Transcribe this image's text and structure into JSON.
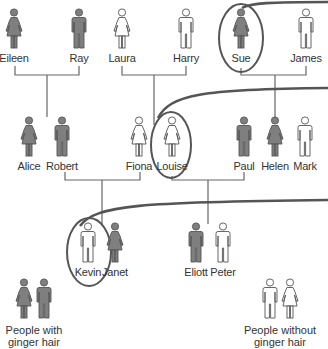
{
  "colors": {
    "ginger_fill": "#7f7f7f",
    "no_ginger_fill": "#ffffff",
    "outline": "#555555",
    "line": "#666666",
    "highlight": "#555555"
  },
  "generations": [
    {
      "row": 1,
      "people": [
        {
          "name": "Eileen",
          "sex": "female",
          "ginger": true,
          "highlighted": false
        },
        {
          "name": "Ray",
          "sex": "male",
          "ginger": true,
          "highlighted": false
        },
        {
          "name": "Laura",
          "sex": "female",
          "ginger": false,
          "highlighted": false
        },
        {
          "name": "Harry",
          "sex": "male",
          "ginger": false,
          "highlighted": false
        },
        {
          "name": "Sue",
          "sex": "female",
          "ginger": true,
          "highlighted": true
        },
        {
          "name": "James",
          "sex": "male",
          "ginger": false,
          "highlighted": false
        }
      ]
    },
    {
      "row": 2,
      "people": [
        {
          "name": "Alice",
          "sex": "female",
          "ginger": true,
          "highlighted": false
        },
        {
          "name": "Robert",
          "sex": "male",
          "ginger": true,
          "highlighted": false
        },
        {
          "name": "Fiona",
          "sex": "female",
          "ginger": false,
          "highlighted": false
        },
        {
          "name": "Louise",
          "sex": "female",
          "ginger": false,
          "highlighted": true
        },
        {
          "name": "Paul",
          "sex": "male",
          "ginger": true,
          "highlighted": false
        },
        {
          "name": "Helen",
          "sex": "female",
          "ginger": true,
          "highlighted": false
        },
        {
          "name": "Mark",
          "sex": "male",
          "ginger": false,
          "highlighted": false
        }
      ]
    },
    {
      "row": 3,
      "people": [
        {
          "name": "Kevin",
          "sex": "male",
          "ginger": false,
          "highlighted": true
        },
        {
          "name": "Janet",
          "sex": "female",
          "ginger": true,
          "highlighted": false
        },
        {
          "name": "Eliott",
          "sex": "male",
          "ginger": true,
          "highlighted": false
        },
        {
          "name": "Peter",
          "sex": "male",
          "ginger": false,
          "highlighted": false
        }
      ]
    }
  ],
  "couples": [
    {
      "partners": [
        "Eileen",
        "Ray"
      ],
      "children": [
        "Alice",
        "Robert"
      ]
    },
    {
      "partners": [
        "Laura",
        "Harry"
      ],
      "children": [
        "Fiona",
        "Louise"
      ]
    },
    {
      "partners": [
        "Sue",
        "James"
      ],
      "children": [
        "Paul",
        "Helen",
        "Mark"
      ]
    },
    {
      "partners": [
        "Robert",
        "Fiona"
      ],
      "children": [
        "Kevin",
        "Janet"
      ]
    },
    {
      "partners": [
        "Louise",
        "Paul"
      ],
      "children": [
        "Eliott",
        "Peter"
      ]
    }
  ],
  "legend": {
    "ginger": {
      "label_line1": "People with",
      "label_line2": "ginger hair"
    },
    "no_ginger": {
      "label_line1": "People without",
      "label_line2": "ginger hair"
    }
  }
}
